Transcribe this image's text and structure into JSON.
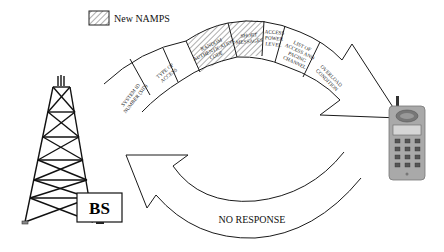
{
  "legend": {
    "pattern": "diagonal-hatch",
    "label": "New NAMPS"
  },
  "forward_arrow": {
    "direction": "base-station-to-mobile",
    "segments": [
      {
        "id": "sid",
        "lines": [
          "SYSTEM ID",
          "NUMBER (SID)"
        ],
        "hatched": false
      },
      {
        "id": "type",
        "lines": [
          "TYPE OF",
          "ACCESS"
        ],
        "hatched": false
      },
      {
        "id": "rand",
        "lines": [
          "RANDOM",
          "AUTHENTICATION",
          "CODE"
        ],
        "hatched": true
      },
      {
        "id": "sms",
        "lines": [
          "SHORT",
          "MESSAGES"
        ],
        "hatched": true
      },
      {
        "id": "power",
        "lines": [
          "ACCESS",
          "POWER",
          "LEVEL"
        ],
        "hatched": false
      },
      {
        "id": "list",
        "lines": [
          "LIST OF",
          "ACCESS AND",
          "PAGING",
          "CHANNEL"
        ],
        "hatched": false
      },
      {
        "id": "overload",
        "lines": [
          "OVERLOAD",
          "CONDITION"
        ],
        "hatched": false
      }
    ]
  },
  "return_arrow": {
    "direction": "mobile-to-base-station",
    "label": "NO RESPONSE"
  },
  "base_station": {
    "label": "BS",
    "icon": "transmission-tower-icon"
  },
  "mobile": {
    "icon": "mobile-phone-icon",
    "colors": {
      "body": "#a9a9a9",
      "screen": "#d6d6d6",
      "keys": "#555555"
    }
  },
  "colors": {
    "line": "#1a1a1a",
    "hatch": "#333333",
    "background": "#ffffff"
  }
}
